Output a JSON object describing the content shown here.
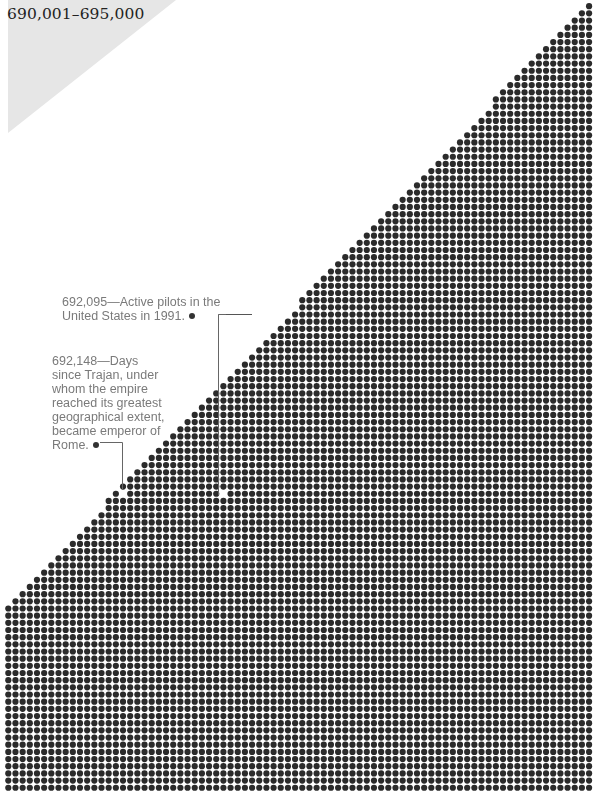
{
  "header": {
    "range_title": "690,001–695,000"
  },
  "dot_field": {
    "description": "Grid of dots, each representing one unit; triangular white area top-left",
    "rows": 110,
    "cols": 82,
    "dot_color": "#2b2b2b",
    "background_color": "#ffffff",
    "corner_color": "#e6e6e6"
  },
  "annotations": [
    {
      "number": "692,095",
      "text_line1": "692,095—Active pilots in the",
      "text_line2": "United States in 1991."
    },
    {
      "number": "692,148",
      "lines": [
        "692,148—Days",
        "since Trajan, under",
        "whom the empire",
        "reached its greatest",
        "geographical extent,",
        "became emperor of",
        "Rome."
      ]
    }
  ]
}
